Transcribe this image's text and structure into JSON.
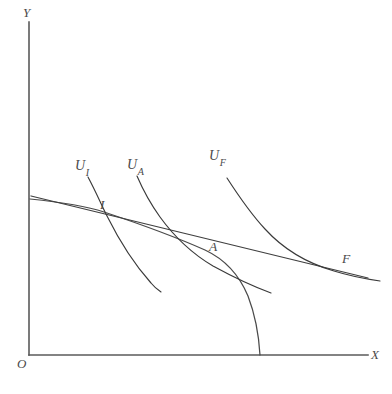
{
  "figure": {
    "domain": "diagram",
    "kind": "production-possibility-frontier-with-indifference-curves",
    "width": 392,
    "height": 394,
    "background_color": "#ffffff",
    "line_color": "#3a3a3a",
    "axis_color": "#5a5a5a"
  },
  "axes": {
    "y_label": "Y",
    "x_label": "X",
    "origin_label": "O",
    "y_axis": {
      "x": 29,
      "y_top": 22,
      "y_bottom": 355
    },
    "x_axis": {
      "y": 355,
      "x_left": 29,
      "x_right": 368
    }
  },
  "curve_labels": {
    "u_i": {
      "base": "U",
      "sub": "I"
    },
    "u_a": {
      "base": "U",
      "sub": "A"
    },
    "u_f": {
      "base": "U",
      "sub": "F"
    }
  },
  "points": {
    "i": {
      "label": "I",
      "x": 104,
      "y": 212
    },
    "a": {
      "label": "A",
      "x": 213,
      "y": 253
    },
    "f": {
      "label": "F",
      "x": 344,
      "y": 266
    }
  },
  "paths": {
    "ppf": "M30,199 C70,203 92,208 104,212 C140,224 178,238 205,250 C222,258 238,272 248,296 C256,317 259,338 260,355",
    "price_line": "M31,196 L368,278",
    "u_i_curve": "M88,177 C96,192 101,204 107,216 C118,238 134,264 151,283 C155,288 158,290 161,292",
    "u_a_curve": "M137,176 C143,190 150,203 160,217 C176,239 196,256 213,266 C235,278 252,286 271,293",
    "u_f_curve": "M227,178 C238,195 250,213 265,229 C285,251 310,264 334,271 C350,276 366,279 380,281"
  },
  "label_positions": {
    "y": {
      "left": 23,
      "top": 6
    },
    "x": {
      "left": 371,
      "top": 348
    },
    "origin": {
      "left": 17,
      "top": 357
    },
    "u_i": {
      "left": 75,
      "top": 159
    },
    "u_a": {
      "left": 127,
      "top": 158
    },
    "u_f": {
      "left": 209,
      "top": 149
    },
    "point_i": {
      "left": 100,
      "top": 198
    },
    "point_a": {
      "left": 209,
      "top": 240
    },
    "point_f": {
      "left": 342,
      "top": 252
    }
  }
}
